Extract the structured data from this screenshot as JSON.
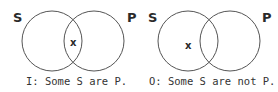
{
  "diagrams": [
    {
      "left_label": "S",
      "right_label": "P",
      "mark": "x",
      "mark_region": "intersection",
      "caption": "I: Some S are P."
    },
    {
      "left_label": "S",
      "right_label": "P",
      "mark": "x",
      "mark_region": "left-only",
      "caption": "O: Some S are not P."
    }
  ],
  "colors": {
    "stroke": "#555555",
    "text": "#2a2a2a"
  }
}
